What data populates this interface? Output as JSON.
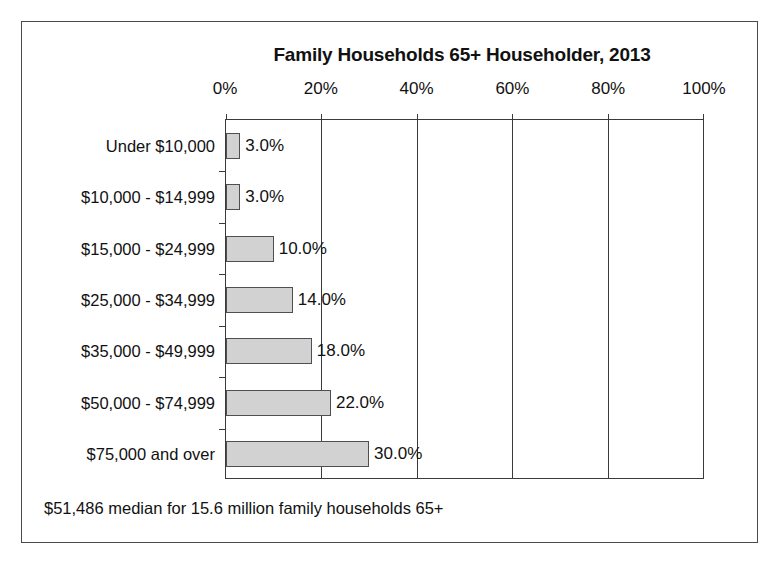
{
  "chart_data": {
    "type": "bar",
    "orientation": "horizontal",
    "title": "Family Households 65+ Householder, 2013",
    "xlabel": "",
    "ylabel": "",
    "xlim": [
      0,
      100
    ],
    "xticks": [
      "0%",
      "20%",
      "40%",
      "60%",
      "80%",
      "100%"
    ],
    "xtick_values": [
      0,
      20,
      40,
      60,
      80,
      100
    ],
    "grid": true,
    "grid_axis": "x",
    "legend": "none",
    "categories": [
      "Under $10,000",
      "$10,000 - $14,999",
      "$15,000 - $24,999",
      "$25,000 - $34,999",
      "$35,000 - $49,999",
      "$50,000 - $74,999",
      "$75,000 and over"
    ],
    "values": [
      3.0,
      3.0,
      10.0,
      14.0,
      18.0,
      22.0,
      30.0
    ],
    "value_labels": [
      "3.0%",
      "3.0%",
      "10.0%",
      "14.0%",
      "18.0%",
      "22.0%",
      "30.0%"
    ],
    "bar_color": "#d2d2d2",
    "bar_border_color": "#4f4f4f",
    "axis_color": "#3a3a3a",
    "annotation": "$51,486 median for 15.6 million family households 65+"
  },
  "footnote": {
    "text": "$51,486 median for 15.6 million family households 65+"
  }
}
